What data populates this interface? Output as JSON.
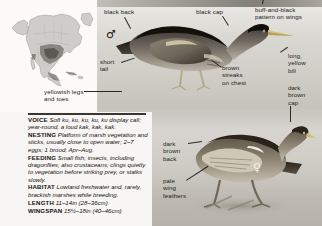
{
  "page": {
    "background_color": "#cfccc6"
  },
  "range_map": {
    "name": "north-america-range-map",
    "region": "North America",
    "style": "greyscale shaded range map"
  },
  "birds": [
    {
      "id": "male",
      "symbol": "♂",
      "label": "male bittern illustration"
    },
    {
      "id": "female",
      "symbol": "♀",
      "label": "female bittern illustration"
    }
  ],
  "annotations": [
    {
      "id": "black-back",
      "text": "black back"
    },
    {
      "id": "black-cap",
      "text": "black cap"
    },
    {
      "id": "buff-and-black-wings",
      "text": "buff-and-black\npattern on wings"
    },
    {
      "id": "short-tail",
      "text": "short\ntail"
    },
    {
      "id": "long-yellow-bill",
      "text": "long,\nyellow\nbill"
    },
    {
      "id": "brown-streaks-chest",
      "text": "brown\nstreaks\non chest"
    },
    {
      "id": "yellowish-legs-toes",
      "text": "yellowish legs\nand toes"
    },
    {
      "id": "dark-brown-cap",
      "text": "dark\nbrown\ncap"
    },
    {
      "id": "dark-brown-back",
      "text": "dark\nbrown\nback"
    },
    {
      "id": "pale-wing-feathers",
      "text": "pale\nwing\nfeathers"
    }
  ],
  "info": {
    "entries": [
      {
        "key": "VOICE",
        "value": "Soft ku, ku, ku, ku, ku display call; year-round, a loud kak, kak, kak."
      },
      {
        "key": "NESTING",
        "value": "Platform of marsh vegetation and sticks, usually close to open water; 2–7 eggs; 1 brood; Apr–Aug."
      },
      {
        "key": "FEEDING",
        "value": "Small fish; insects, including dragonflies; also crustaceans; clings quietly to vegetation before striking prey, or stalks slowly."
      },
      {
        "key": "HABITAT",
        "value": "Lowland freshwater and, rarely, brackish marshes while breeding."
      },
      {
        "key": "LENGTH",
        "value": "11–14in (28–36cm)"
      },
      {
        "key": "WINGSPAN",
        "value": "15½–18in (40–46cm)"
      }
    ]
  }
}
